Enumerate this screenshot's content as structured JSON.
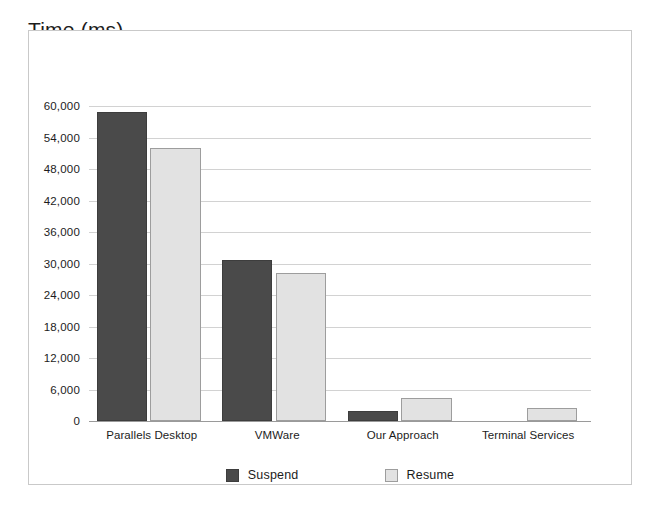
{
  "chart_data": {
    "type": "bar",
    "title": "Time (ms)",
    "xlabel": "",
    "ylabel": "Time (ms)",
    "ylim": [
      0,
      60000
    ],
    "ytick_labels": [
      "60,000",
      "54,000",
      "48,000",
      "42,000",
      "36,000",
      "30,000",
      "24,000",
      "18,000",
      "12,000",
      "6,000",
      "0"
    ],
    "ytick_values": [
      60000,
      54000,
      48000,
      42000,
      36000,
      30000,
      24000,
      18000,
      12000,
      6000,
      0
    ],
    "grid": true,
    "legend_position": "bottom",
    "categories": [
      "Parallels Desktop",
      "VMWare",
      "Our Approach",
      "Terminal Services"
    ],
    "series": [
      {
        "name": "Suspend",
        "color": "#4a4a4a",
        "values": [
          58800,
          30700,
          2000,
          null
        ]
      },
      {
        "name": "Resume",
        "color": "#e2e2e2",
        "values": [
          52000,
          28200,
          4300,
          2500
        ]
      }
    ]
  }
}
